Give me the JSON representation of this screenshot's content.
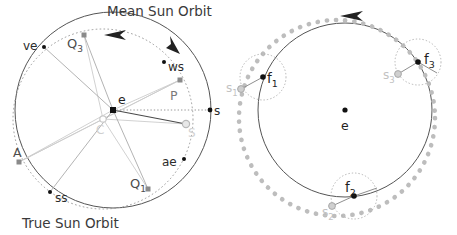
{
  "figure": {
    "title_top": "Mean Sun Orbit",
    "title_bottom": "True Sun Orbit"
  },
  "left_panel": {
    "name": "mean-and-true-sun-orbit-diagram",
    "center_cx": 113,
    "center_cy": 110,
    "true_orbit_r": 98,
    "mean_orbit_r": 90,
    "mean_orbit_cx": 103,
    "mean_orbit_cy": 119,
    "points": [
      {
        "id": "e",
        "label": "e",
        "x": 113,
        "y": 110,
        "marker": "square-black",
        "lx": 118,
        "ly": 101,
        "tone": "dark"
      },
      {
        "id": "C",
        "label": "C",
        "x": 103,
        "y": 119,
        "marker": "circle-gray",
        "lx": 97,
        "ly": 131,
        "tone": "light"
      },
      {
        "id": "ve",
        "label": "ve",
        "x": 44,
        "y": 47,
        "marker": "dot-black",
        "lx": 23,
        "ly": 46,
        "tone": "dark"
      },
      {
        "id": "ws",
        "label": "ws",
        "x": 164,
        "y": 62,
        "marker": "dot-black",
        "lx": 168,
        "ly": 68,
        "tone": "dark"
      },
      {
        "id": "ae",
        "label": "ae",
        "x": 184,
        "y": 159,
        "marker": "dot-black",
        "lx": 163,
        "ly": 163,
        "tone": "dark"
      },
      {
        "id": "ss",
        "label": "ss",
        "x": 50,
        "y": 192,
        "marker": "dot-black",
        "lx": 55,
        "ly": 198,
        "tone": "dark"
      },
      {
        "id": "Q3",
        "label": "Q",
        "sub": "3",
        "x": 84,
        "y": 35,
        "marker": "square-gray",
        "lx": 69,
        "ly": 48,
        "tone": "mid"
      },
      {
        "id": "Q1",
        "label": "Q",
        "sub": "1",
        "x": 148,
        "y": 189,
        "marker": "square-gray",
        "lx": 132,
        "ly": 186,
        "tone": "mid"
      },
      {
        "id": "A",
        "label": "A",
        "x": 19,
        "y": 162,
        "marker": "square-gray",
        "lx": 16,
        "ly": 153,
        "tone": "mid"
      },
      {
        "id": "P",
        "label": "P",
        "x": 180,
        "y": 80,
        "marker": "square-gray",
        "lx": 172,
        "ly": 96,
        "tone": "mid"
      },
      {
        "id": "s",
        "label": "s",
        "x": 210,
        "y": 110,
        "marker": "dot-black",
        "lx": 214,
        "ly": 112,
        "tone": "dark"
      },
      {
        "id": "S",
        "label": "S",
        "x": 186,
        "y": 124,
        "marker": "circle-gray",
        "lx": 190,
        "ly": 133,
        "tone": "light"
      }
    ],
    "arrows": [
      {
        "id": "mean-orbit-arrow-top",
        "x": 115,
        "y": 33,
        "angle": 182
      },
      {
        "id": "true-orbit-arrow-right",
        "x": 176,
        "y": 45,
        "angle": 58
      }
    ]
  },
  "right_panel": {
    "name": "epicycle-sun-positions-diagram",
    "center_cx": 345,
    "center_cy": 110,
    "deferent_r": 87,
    "dotted_circle_cx": 337,
    "dotted_circle_cy": 118,
    "dotted_circle_r": 98,
    "epicycle_r": 23,
    "points": [
      {
        "id": "e",
        "label": "e",
        "x": 345,
        "y": 110,
        "marker": "dot-black",
        "lx": 341,
        "ly": 126,
        "tone": "dark"
      },
      {
        "id": "f1",
        "label": "f",
        "sub": "1",
        "x": 263,
        "y": 77,
        "marker": "dot-black",
        "lx": 267,
        "ly": 80,
        "tone": "dark"
      },
      {
        "id": "f2",
        "label": "f",
        "sub": "2",
        "x": 354,
        "y": 196,
        "marker": "dot-black",
        "lx": 346,
        "ly": 190,
        "tone": "dark"
      },
      {
        "id": "f3",
        "label": "f",
        "sub": "3",
        "x": 418,
        "y": 62,
        "marker": "dot-black",
        "lx": 424,
        "ly": 60,
        "tone": "dark"
      },
      {
        "id": "s1",
        "label": "s",
        "sub": "1",
        "x": 241,
        "y": 89,
        "marker": "circle-gray",
        "lx": 228,
        "ly": 90,
        "tone": "light"
      },
      {
        "id": "s2",
        "label": "s",
        "sub": "2",
        "x": 332,
        "y": 206,
        "marker": "circle-gray",
        "lx": 324,
        "ly": 213,
        "tone": "light"
      },
      {
        "id": "s3",
        "label": "s",
        "sub": "3",
        "x": 398,
        "y": 74,
        "marker": "circle-gray",
        "lx": 385,
        "ly": 76,
        "tone": "light"
      }
    ],
    "arrows": [
      {
        "id": "deferent-arrow-top",
        "x": 352,
        "y": 15,
        "angle": 186
      }
    ]
  },
  "colors": {
    "stroke_dark": "#444444",
    "stroke_mid": "#888888",
    "stroke_light": "#bbbbbb",
    "dotted_gray": "#b3b3b3",
    "text_dark": "#2b2b2b",
    "text_mid": "#777777",
    "text_light": "#c2c2c2",
    "background": "#ffffff"
  }
}
